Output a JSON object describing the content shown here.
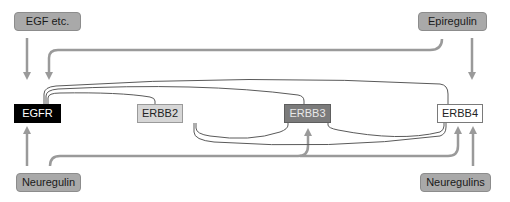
{
  "ligands": {
    "egf": {
      "label": "EGF etc.",
      "targets": [
        "EGFR"
      ]
    },
    "epiregulin": {
      "label": "Epiregulin",
      "targets": [
        "EGFR",
        "ERBB4"
      ]
    },
    "neuregulin": {
      "label": "Neuregulin",
      "targets": [
        "EGFR",
        "ERBB3",
        "ERBB4"
      ]
    },
    "neuregulins": {
      "label": "Neuregulins",
      "targets": [
        "ERBB4"
      ]
    }
  },
  "receptors": {
    "egfr": {
      "label": "EGFR",
      "fill": "#000000"
    },
    "erbb2": {
      "label": "ERBB2",
      "fill": "#d6d6d6"
    },
    "erbb3": {
      "label": "ERBB3",
      "fill": "#7b7b7b"
    },
    "erbb4": {
      "label": "ERBB4",
      "fill": "#ffffff"
    }
  },
  "dimerization_links": [
    [
      "EGFR",
      "ERBB2"
    ],
    [
      "EGFR",
      "ERBB3"
    ],
    [
      "EGFR",
      "ERBB4"
    ],
    [
      "ERBB2",
      "ERBB3"
    ],
    [
      "ERBB2",
      "ERBB4"
    ],
    [
      "ERBB3",
      "ERBB4"
    ]
  ],
  "colors": {
    "arrow": "#9a9a9a",
    "link": "#555555",
    "ligand_fill": "#a9a9a9"
  }
}
